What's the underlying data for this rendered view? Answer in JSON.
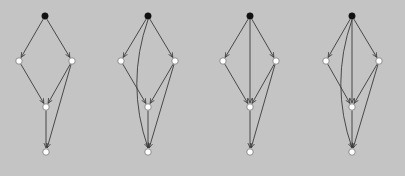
{
  "figure": {
    "background": "#c4c4c4",
    "edge_color": "#3a3a3a",
    "source_node_color": "#111111",
    "node_color": "#ffffff",
    "node_stroke": "#555555"
  },
  "graphs": [
    {
      "id": "graph-1",
      "nodes": {
        "T": [
          45,
          16
        ],
        "L": [
          19,
          61
        ],
        "R": [
          72,
          61
        ],
        "M": [
          46,
          107
        ],
        "B": [
          46,
          152
        ]
      },
      "edges": [
        [
          "T",
          "L"
        ],
        [
          "T",
          "R"
        ],
        [
          "L",
          "M"
        ],
        [
          "R",
          "M"
        ],
        [
          "M",
          "B"
        ],
        [
          "R",
          "B"
        ]
      ],
      "curved_edges": []
    },
    {
      "id": "graph-2",
      "nodes": {
        "T": [
          148,
          16
        ],
        "L": [
          121,
          61
        ],
        "R": [
          175,
          61
        ],
        "M": [
          148,
          107
        ],
        "B": [
          148,
          152
        ]
      },
      "edges": [
        [
          "T",
          "L"
        ],
        [
          "T",
          "R"
        ],
        [
          "L",
          "M"
        ],
        [
          "R",
          "M"
        ],
        [
          "M",
          "B"
        ],
        [
          "R",
          "B"
        ]
      ],
      "curved_edges": [
        [
          "T",
          "B",
          -14
        ]
      ]
    },
    {
      "id": "graph-3",
      "nodes": {
        "T": [
          250,
          16
        ],
        "L": [
          223,
          61
        ],
        "R": [
          276,
          61
        ],
        "M": [
          250,
          107
        ],
        "B": [
          250,
          152
        ]
      },
      "edges": [
        [
          "T",
          "L"
        ],
        [
          "T",
          "R"
        ],
        [
          "L",
          "M"
        ],
        [
          "R",
          "M"
        ],
        [
          "M",
          "B"
        ],
        [
          "R",
          "B"
        ],
        [
          "T",
          "M"
        ]
      ],
      "curved_edges": []
    },
    {
      "id": "graph-4",
      "nodes": {
        "T": [
          352,
          16
        ],
        "L": [
          326,
          61
        ],
        "R": [
          379,
          61
        ],
        "M": [
          352,
          107
        ],
        "B": [
          352,
          152
        ]
      },
      "edges": [
        [
          "T",
          "L"
        ],
        [
          "T",
          "R"
        ],
        [
          "L",
          "M"
        ],
        [
          "R",
          "M"
        ],
        [
          "M",
          "B"
        ],
        [
          "R",
          "B"
        ],
        [
          "T",
          "M"
        ]
      ],
      "curved_edges": [
        [
          "T",
          "B",
          -14
        ]
      ]
    }
  ]
}
